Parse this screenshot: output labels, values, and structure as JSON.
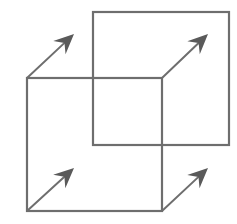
{
  "diagram": {
    "title": "",
    "canvas": {
      "width": 237,
      "height": 224,
      "background": "#ffffff"
    },
    "colors": {
      "line": "#6e6e6e",
      "arrowhead": "#5a5a5a"
    },
    "shapes": [
      {
        "id": "back-square",
        "x": 93,
        "y": 12,
        "width": 136,
        "height": 133
      },
      {
        "id": "front-square",
        "x": 27,
        "y": 78,
        "width": 135,
        "height": 133
      }
    ],
    "arrows": [
      {
        "id": "arrow-top-left",
        "from": [
          27,
          78
        ],
        "to": [
          74,
          34
        ]
      },
      {
        "id": "arrow-top-right",
        "from": [
          162,
          78
        ],
        "to": [
          208,
          34
        ]
      },
      {
        "id": "arrow-bottom-left",
        "from": [
          27,
          211
        ],
        "to": [
          74,
          168
        ]
      },
      {
        "id": "arrow-bottom-right",
        "from": [
          162,
          211
        ],
        "to": [
          208,
          168
        ]
      }
    ],
    "labels": []
  }
}
